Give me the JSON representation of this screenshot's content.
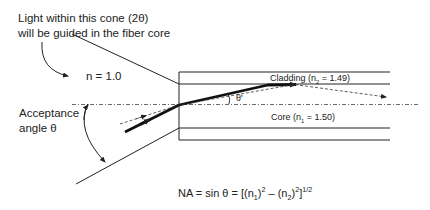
{
  "caption": {
    "line1": "Light within this cone (2θ)",
    "line2": "will be guided in the fiber core"
  },
  "outer_medium": {
    "label": "n = 1.0"
  },
  "acceptance": {
    "line1": "Acceptance",
    "line2": "angle θ"
  },
  "cladding": {
    "label_prefix": "Cladding (n",
    "subscript": "2",
    "label_suffix": " = 1.49)"
  },
  "core": {
    "label_prefix": "Core (n",
    "subscript": "1",
    "label_suffix": " = 1.50)"
  },
  "internal_angle": {
    "label": "θ'"
  },
  "equation": {
    "lhs": "NA = sin θ = [(n",
    "sub1": "1",
    "mid1": ")",
    "sup1": "2",
    "mid2": " – (n",
    "sub2": "2",
    "mid3": ")",
    "sup2": "2",
    "mid4": "]",
    "sup3": "1/2"
  },
  "colors": {
    "stroke": "#222222",
    "background": "#ffffff"
  }
}
